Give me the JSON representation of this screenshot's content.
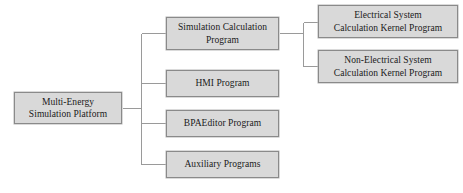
{
  "diagram": {
    "type": "tree-hierarchy",
    "title": "",
    "style": {
      "node_fill": "#d9d9d9",
      "node_border": "#8a8a8a",
      "connector_color": "#9a9a9a",
      "background": "#ffffff",
      "text_color": "#1a1a1a"
    },
    "nodes": [
      {
        "id": "root",
        "label": "Multi-Energy\nSimulation Platform",
        "level": 0
      },
      {
        "id": "sim-calc",
        "label": "Simulation Calculation\nProgram",
        "level": 1
      },
      {
        "id": "hmi",
        "label": "HMI Program",
        "level": 1
      },
      {
        "id": "bpaeditor",
        "label": "BPAEditor Program",
        "level": 1
      },
      {
        "id": "auxiliary",
        "label": "Auxiliary Programs",
        "level": 1
      },
      {
        "id": "electrical",
        "label": "Electrical System\nCalculation Kernel Program",
        "level": 2
      },
      {
        "id": "non-electrical",
        "label": "Non-Electrical System\nCalculation Kernel Program",
        "level": 2
      }
    ],
    "edges": [
      {
        "from": "root",
        "to": "sim-calc"
      },
      {
        "from": "root",
        "to": "hmi"
      },
      {
        "from": "root",
        "to": "bpaeditor"
      },
      {
        "from": "root",
        "to": "auxiliary"
      },
      {
        "from": "sim-calc",
        "to": "electrical"
      },
      {
        "from": "sim-calc",
        "to": "non-electrical"
      }
    ]
  }
}
